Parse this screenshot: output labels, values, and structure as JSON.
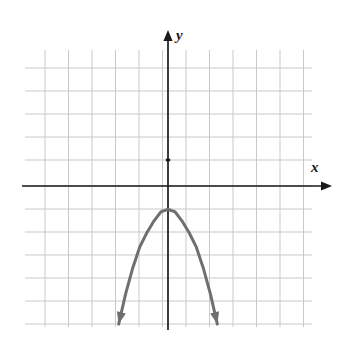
{
  "figure": {
    "background_color": "#ffffff",
    "width": 343,
    "height": 340
  },
  "axes": {
    "x_label": "x",
    "y_label": "y",
    "axis_color": "#1a1a1a",
    "origin_px": {
      "x": 168,
      "y": 186
    },
    "x_axis_px": {
      "x1": 22,
      "y1": 186,
      "x2": 332,
      "y2": 186
    },
    "y_axis_px": {
      "x1": 168,
      "y1": 30,
      "x2": 168,
      "y2": 330
    },
    "arrowheads": [
      "x-positive",
      "y-positive"
    ],
    "tick_mark_px": {
      "x": 168,
      "y": 160
    }
  },
  "grid": {
    "color": "#c9c9c9",
    "line_width": 1,
    "cell_width_px": 23.5,
    "cell_height_px": 23.4,
    "vertical_lines_px": [
      45,
      68.5,
      92,
      115.5,
      139,
      162.5,
      168,
      186,
      209.5,
      233,
      256.5,
      280,
      287
    ],
    "horizontal_lines_px": [
      68,
      91,
      114,
      137,
      160,
      186,
      209,
      232,
      255,
      278,
      301,
      324
    ],
    "columns": 11,
    "rows": 12,
    "left_px": 25,
    "right_px": 312,
    "top_px": 50,
    "bottom_px": 327
  },
  "chart_data": {
    "type": "line",
    "title": "",
    "subtitle": "",
    "xlabel": "x",
    "ylabel": "y",
    "xlim": [
      -6,
      5
    ],
    "ylim": [
      -6,
      6
    ],
    "grid": true,
    "legend": null,
    "curve": {
      "name": "parabola",
      "equation": "y = -a(x)^2 - 1",
      "orientation": "opens-downward",
      "vertex": {
        "x": 0,
        "y": -1
      },
      "axis_of_symmetry": "x = 0",
      "color": "#6f6f6f",
      "stroke_width": 3,
      "arrow_ends": [
        "both"
      ],
      "x": [
        -2.1,
        -1.8,
        -1.5,
        -1.2,
        -0.9,
        -0.6,
        -0.3,
        0.0,
        0.3,
        0.6,
        0.9,
        1.2,
        1.5,
        1.8,
        2.1
      ],
      "y": [
        -5.9,
        -4.6,
        -3.5,
        -2.6,
        -2.0,
        -1.5,
        -1.1,
        -1.0,
        -1.1,
        -1.5,
        -2.0,
        -2.6,
        -3.5,
        -4.6,
        -5.9
      ],
      "endpoints_px": [
        {
          "x": 118,
          "y": 323
        },
        {
          "x": 221,
          "y": 322
        }
      ],
      "vertex_px": {
        "x": 168,
        "y": 207
      }
    }
  }
}
